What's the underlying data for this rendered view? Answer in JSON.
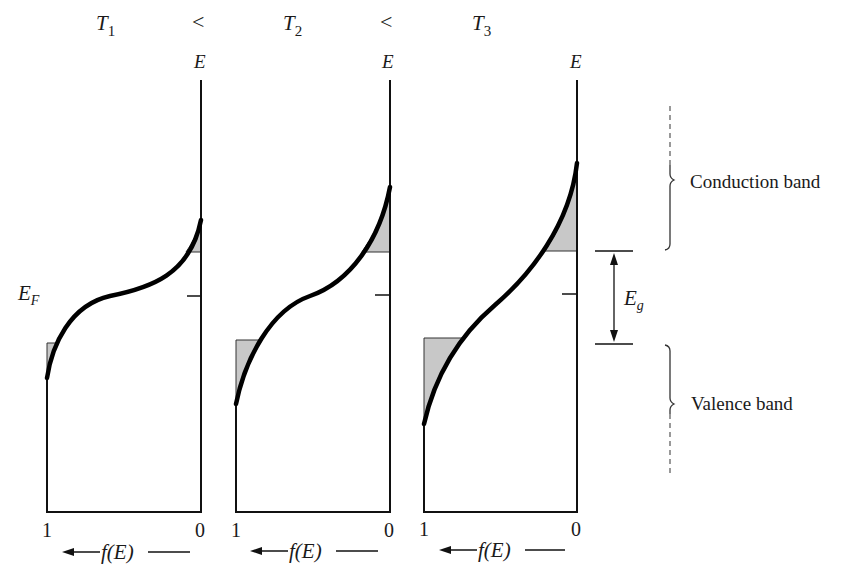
{
  "title": {
    "t1": "T",
    "t1_sub": "1",
    "lt1": "<",
    "t2": "T",
    "t2_sub": "2",
    "lt2": "<",
    "t3": "T",
    "t3_sub": "3"
  },
  "panels": [
    {
      "axis_label": "E",
      "x_left_label": "1",
      "x_right_label": "0",
      "xlabel": "f(E)"
    },
    {
      "axis_label": "E",
      "x_left_label": "1",
      "x_right_label": "0",
      "xlabel": "f(E)"
    },
    {
      "axis_label": "E",
      "x_left_label": "1",
      "x_right_label": "0",
      "xlabel": "f(E)"
    }
  ],
  "fermi_label": "E",
  "fermi_sub": "F",
  "gap_label": "E",
  "gap_sub": "g",
  "conduction_label": "Conduction band",
  "valence_label": "Valence band",
  "colors": {
    "line": "#111111",
    "shade": "#c8c8c8",
    "dash": "#555555"
  }
}
